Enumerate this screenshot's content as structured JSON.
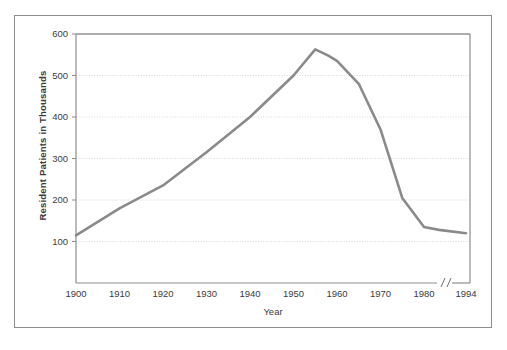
{
  "figure": {
    "background_color": "#ffffff",
    "frame_color": "#8d8d8d"
  },
  "chart_data": {
    "type": "line",
    "title": "",
    "xlabel": "Year",
    "ylabel": "Resident Patients in Thousands",
    "xlim": [
      1900,
      1994
    ],
    "ylim": [
      0,
      600
    ],
    "grid": true,
    "grid_axis": "y",
    "legend": "none",
    "line_color": "#8a8a8a",
    "line_width": 2.6,
    "axis_break": {
      "symbol": "//",
      "between": [
        1980,
        1994
      ],
      "note": "x-axis broken between 1980 and 1994"
    },
    "yticks": [
      100,
      200,
      300,
      400,
      500,
      600
    ],
    "ytick_labels": [
      "100",
      "200",
      "300",
      "400",
      "500",
      "600"
    ],
    "xticks": [
      1900,
      1910,
      1920,
      1930,
      1940,
      1950,
      1960,
      1970,
      1980,
      1994
    ],
    "xtick_labels": [
      "1900",
      "1910",
      "1920",
      "1930",
      "1940",
      "1950",
      "1960",
      "1970",
      "1980",
      "1994"
    ],
    "x": [
      1900,
      1910,
      1920,
      1930,
      1940,
      1950,
      1955,
      1958,
      1960,
      1965,
      1970,
      1975,
      1980,
      1985,
      1994
    ],
    "values": [
      115,
      180,
      235,
      315,
      400,
      500,
      563,
      548,
      535,
      480,
      370,
      205,
      135,
      128,
      120
    ],
    "series": [
      {
        "name": "Resident Patients",
        "x": [
          1900,
          1910,
          1920,
          1930,
          1940,
          1950,
          1955,
          1958,
          1960,
          1965,
          1970,
          1975,
          1980,
          1985,
          1994
        ],
        "values": [
          115,
          180,
          235,
          315,
          400,
          500,
          563,
          548,
          535,
          480,
          370,
          205,
          135,
          128,
          120
        ]
      }
    ]
  }
}
